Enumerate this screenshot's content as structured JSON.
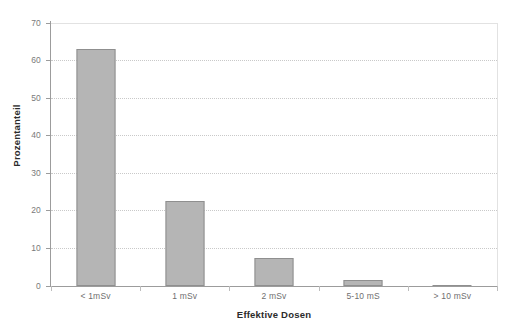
{
  "chart_data": {
    "type": "bar",
    "title": "",
    "subtitle": "",
    "xlabel": "Effektive Dosen",
    "ylabel": "Prozentanteil",
    "categories": [
      "< 1mSv",
      "1 mSv",
      "2 mSv",
      "5-10 mS",
      "> 10 mSv"
    ],
    "values": [
      63.0,
      22.7,
      7.5,
      1.6,
      0.2
    ],
    "series": [
      {
        "name": "Prozentanteil",
        "values": [
          63.0,
          22.7,
          7.5,
          1.6,
          0.2
        ]
      }
    ],
    "ylim": [
      0,
      70
    ],
    "yticks": [
      0,
      10,
      20,
      30,
      40,
      50,
      60,
      70
    ],
    "ytick_labels": [
      "0",
      "10",
      "20",
      "30",
      "40",
      "50",
      "60",
      "70"
    ],
    "xlim_categories": 5,
    "grid": {
      "horizontal": true,
      "vertical": false,
      "style": "dotted",
      "color": "#c9c9c9"
    },
    "legend": {
      "visible": false,
      "position": "none",
      "entries": []
    },
    "annotations": [],
    "colors": {
      "bar_fill": "#b5b5b5",
      "bar_edge": "#8f8f8f",
      "axis_line": "#9c9c9c",
      "grid_line": "#c9c9c9",
      "tick_label": "#6f6f6f",
      "axis_title": "#2b2b2b",
      "plot_background": "#ffffff",
      "plot_border": "#e2e2e2"
    }
  },
  "axes": {
    "y": {
      "title": "Prozentanteil",
      "ticks": [
        {
          "value": 70,
          "label": "70"
        },
        {
          "value": 60,
          "label": "60"
        },
        {
          "value": 50,
          "label": "50"
        },
        {
          "value": 40,
          "label": "40"
        },
        {
          "value": 30,
          "label": "30"
        },
        {
          "value": 20,
          "label": "20"
        },
        {
          "value": 10,
          "label": "10"
        },
        {
          "value": 0,
          "label": "0"
        }
      ]
    },
    "x": {
      "title": "Effektive Dosen",
      "ticks": [
        {
          "label": "< 1mSv"
        },
        {
          "label": "1 mSv"
        },
        {
          "label": "2 mSv"
        },
        {
          "label": "5-10 mS"
        },
        {
          "label": "> 10 mSv"
        }
      ]
    }
  },
  "bars": [
    {
      "category": "< 1mSv",
      "value": 63.0
    },
    {
      "category": "1 mSv",
      "value": 22.7
    },
    {
      "category": "2 mSv",
      "value": 7.5
    },
    {
      "category": "5-10 mS",
      "value": 1.6
    },
    {
      "category": "> 10 mSv",
      "value": 0.2
    }
  ]
}
